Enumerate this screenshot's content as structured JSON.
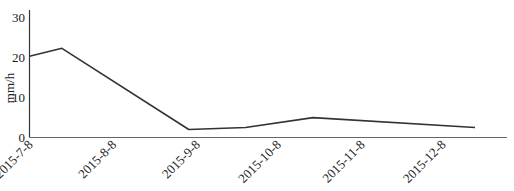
{
  "chart_data": {
    "type": "line",
    "title": "",
    "xlabel": "",
    "ylabel": "mm/h",
    "ylim": [
      0,
      30
    ],
    "yticks": [
      0,
      10,
      20,
      30
    ],
    "grid": false,
    "legend": null,
    "xtick_labels": [
      "2015-7-8",
      "2015-8-8",
      "2015-9-8",
      "2015-10-8",
      "2015-11-8",
      "2015-12-8"
    ],
    "series": [
      {
        "name": "rainfall intensity",
        "color": "#333333",
        "points": [
          {
            "x": "2015-7-8",
            "y": 20.4
          },
          {
            "x": "2015-7-20",
            "y": 22.4
          },
          {
            "x": "2015-9-5",
            "y": 2.0
          },
          {
            "x": "2015-9-26",
            "y": 2.5
          },
          {
            "x": "2015-10-21",
            "y": 5.0
          },
          {
            "x": "2015-12-20",
            "y": 2.5
          }
        ]
      }
    ]
  }
}
